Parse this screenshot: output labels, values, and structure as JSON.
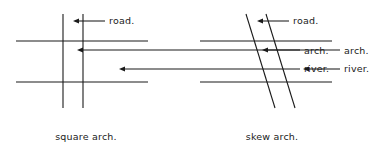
{
  "figure": {
    "background": "#ffffff",
    "ink": "#1a1a1a"
  },
  "panels": [
    {
      "id": "square-arch",
      "caption": "square arch.",
      "caption_x": 86,
      "caption_y": 140,
      "roads": [
        {
          "x1": 63,
          "y1": 14,
          "x2": 63,
          "y2": 108
        },
        {
          "x1": 83,
          "y1": 14,
          "x2": 83,
          "y2": 108
        }
      ],
      "rivers": [
        {
          "x1": 16,
          "y1": 41,
          "x2": 148,
          "y2": 41
        },
        {
          "x1": 16,
          "y1": 82,
          "x2": 148,
          "y2": 82
        }
      ],
      "labels": [
        {
          "name": "road",
          "text": "road.",
          "text_x": 109,
          "text_y": 24,
          "leader_x1": 73,
          "leader_x2": 105,
          "leader_y": 21,
          "arrow_dir": "left"
        },
        {
          "name": "arch",
          "text": "arch.",
          "text_x": 304,
          "text_y": 54,
          "leader_x1": 77,
          "leader_x2": 300,
          "leader_y": 50,
          "arrow_dir": "left"
        },
        {
          "name": "river",
          "text": "river.",
          "text_x": 304,
          "text_y": 72,
          "leader_x1": 119,
          "leader_x2": 300,
          "leader_y": 69,
          "arrow_dir": "left"
        }
      ]
    },
    {
      "id": "skew-arch",
      "caption": "skew arch.",
      "caption_x": 272,
      "caption_y": 140,
      "roads": [
        {
          "x1": 246,
          "y1": 14,
          "x2": 275,
          "y2": 108
        },
        {
          "x1": 266,
          "y1": 14,
          "x2": 295,
          "y2": 108
        }
      ],
      "rivers": [
        {
          "x1": 200,
          "y1": 41,
          "x2": 332,
          "y2": 41
        },
        {
          "x1": 200,
          "y1": 82,
          "x2": 332,
          "y2": 82
        }
      ],
      "labels": [
        {
          "name": "road",
          "text": "road.",
          "text_x": 293,
          "text_y": 24,
          "leader_x1": 257,
          "leader_x2": 289,
          "leader_y": 21,
          "arrow_dir": "left"
        },
        {
          "name": "arch",
          "text": "arch.",
          "text_x": 344,
          "text_y": 54,
          "leader_x1": 262,
          "leader_x2": 340,
          "leader_y": 50,
          "arrow_dir": "left"
        },
        {
          "name": "river",
          "text": "river.",
          "text_x": 344,
          "text_y": 72,
          "leader_x1": 303,
          "leader_x2": 340,
          "leader_y": 69,
          "arrow_dir": "left"
        }
      ]
    }
  ]
}
